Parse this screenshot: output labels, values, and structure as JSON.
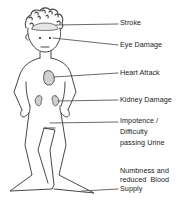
{
  "diagram": {
    "labels": [
      {
        "id": "stroke",
        "text": "Stroke"
      },
      {
        "id": "eye",
        "text": "Eye Damage"
      },
      {
        "id": "heart",
        "text": "Heart Attack"
      },
      {
        "id": "kidney",
        "text": "Kidney Damage"
      },
      {
        "id": "impotence",
        "lines": [
          "Impotence /",
          "Difficulty",
          "passing Urine"
        ]
      },
      {
        "id": "numbness",
        "lines": [
          "Numbness and",
          "reduced  Blood",
          "Supply"
        ]
      }
    ],
    "colors": {
      "line": "#333333",
      "organ_fill": "#d8d8d8",
      "hair": "#444444"
    }
  }
}
